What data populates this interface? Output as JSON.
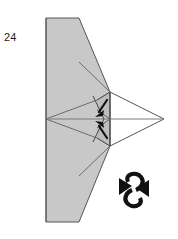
{
  "canvas": {
    "width": 178,
    "height": 239,
    "background": "#ffffff"
  },
  "label": {
    "step_number": "24"
  },
  "palette": {
    "paper_gray": "#c8c8c8",
    "paper_gray_shaded": "#bdbdbd",
    "paper_white": "#ffffff",
    "outline": "#555555",
    "crease": "#6b6b6b",
    "center_line": "#7a7a7a",
    "arrow_black": "#111111",
    "text": "#1a1a1a"
  },
  "figure": {
    "name": "origami-folded-model",
    "body_outline_points": "46,18 79,18 110,92 110,146 79,222 46,222",
    "upper_wing_points": "46,18 79,18 110,92 110,119 46,119",
    "lower_wing_points": "46,119 110,119 110,146 79,222 46,222",
    "upper_crease_points": "79,62 110,92 110,119",
    "lower_crease_points": "79,176 110,146 110,119",
    "upper_inner_crease_points": "46,119 97,100 110,92",
    "lower_inner_crease_points": "46,119 97,138 110,146",
    "white_flap_points": "110,92 164,119 110,146",
    "white_flap_inner_upper": "110,92 164,119",
    "white_flap_inner_lower": "110,146 164,119",
    "center_line": {
      "x1": 46,
      "y1": 119,
      "x2": 164,
      "y2": 119
    },
    "left_edge": {
      "x1": 46,
      "y1": 18,
      "x2": 46,
      "y2": 222
    },
    "vertical_fold_edge": {
      "x1": 110,
      "y1": 92,
      "x2": 110,
      "y2": 146
    },
    "right_tip": {
      "x": 164,
      "y": 119
    },
    "small_pleat_upper": "97,100 110,92 110,119 97,110",
    "small_pleat_lower": "97,138 110,146 110,119 97,128"
  },
  "arrows": [
    {
      "name": "fold-arrow-upper",
      "direction": "down-left",
      "tail": {
        "x": 106,
        "y": 101
      },
      "head": {
        "x": 96,
        "y": 115
      },
      "color": "#111111"
    },
    {
      "name": "fold-arrow-lower",
      "direction": "up-left",
      "tail": {
        "x": 106,
        "y": 137
      },
      "head": {
        "x": 96,
        "y": 123
      },
      "color": "#111111"
    }
  ],
  "symbols": [
    {
      "name": "turn-over-symbol",
      "meaning": "turn the model over",
      "center": {
        "x": 134,
        "y": 190
      },
      "color": "#111111"
    }
  ]
}
